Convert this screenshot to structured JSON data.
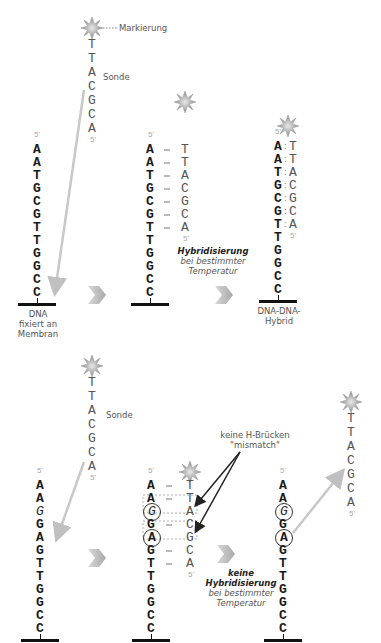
{
  "labels": {
    "marker": "Markierung",
    "probe": "Sonde",
    "dna_fixed": [
      "DNA",
      "fixiert an",
      "Membran"
    ],
    "hybrid": [
      "DNA-DNA-",
      "Hybrid"
    ],
    "hybridization_bold": "Hybridisierung",
    "hybridization_rest": [
      "bei bestimmter",
      "Temperatur"
    ],
    "no_hybridization_bold_1": "keine",
    "no_hybridization_bold_2": "Hybridisierung",
    "no_hybridization_rest": [
      "bei bestimmter",
      "Temperatur"
    ],
    "mismatch": [
      "keine H-Brücken",
      "\"mismatch\""
    ],
    "prime5": "5'"
  },
  "top_panel": {
    "probe_sequence": [
      "T",
      "T",
      "A",
      "C",
      "G",
      "C",
      "A"
    ],
    "target_sequence": [
      "A",
      "A",
      "T",
      "G",
      "C",
      "G",
      "T",
      "T",
      "G",
      "G",
      "C",
      "C"
    ]
  },
  "bottom_panel": {
    "probe_sequence": [
      "T",
      "T",
      "A",
      "C",
      "G",
      "C",
      "A"
    ],
    "target_sequence": [
      "A",
      "A",
      "G",
      "G",
      "A",
      "G",
      "T",
      "T",
      "G",
      "G",
      "C",
      "C"
    ],
    "mismatch_positions": [
      2,
      4
    ]
  },
  "colors": {
    "target_text": "#1a1a1a",
    "probe_text": "#555555",
    "arrow_gray": "#bbbbbb",
    "chevron": "#c8c8c8",
    "membrane": "#111111"
  }
}
